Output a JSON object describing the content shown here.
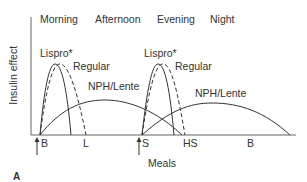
{
  "figure": {
    "panel_label": "A",
    "y_axis_label": "Insulin effect",
    "x_axis_label": "Meals",
    "time_periods": [
      {
        "label": "Morning",
        "x": 40
      },
      {
        "label": "Afternoon",
        "x": 95
      },
      {
        "label": "Evening",
        "x": 157
      },
      {
        "label": "Night",
        "x": 210
      }
    ],
    "meal_markers": [
      {
        "label": "B",
        "x": 41,
        "arrow": true
      },
      {
        "label": "L",
        "x": 85,
        "arrow": false
      },
      {
        "label": "S",
        "x": 143,
        "arrow": true
      },
      {
        "label": "HS",
        "x": 184,
        "arrow": false
      },
      {
        "label": "B",
        "x": 247,
        "arrow": false
      }
    ],
    "curve_labels": {
      "lispro_morning": "Lispro*",
      "regular_morning": "Regular",
      "nph_morning": "NPH/Lente",
      "lispro_evening": "Lispro*",
      "regular_evening": "Regular",
      "nph_evening": "NPH/Lente"
    },
    "colors": {
      "line": "#333333",
      "text": "#333333",
      "axis": "#555555"
    }
  }
}
